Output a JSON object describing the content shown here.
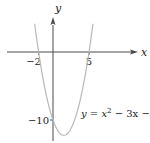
{
  "chart_data": {
    "type": "line",
    "title": "",
    "xlabel": "x",
    "ylabel": "y",
    "equation": {
      "lhs": "y = x",
      "exp": "2",
      "rhs": " − 3x − 10"
    },
    "function": {
      "a": 1,
      "b": -3,
      "c": -10
    },
    "x_ticks": [
      {
        "value": -2,
        "label": "−2"
      },
      {
        "value": 5,
        "label": "5"
      }
    ],
    "y_ticks": [
      {
        "value": -10,
        "label": "−10"
      }
    ],
    "xlim": [
      -6.4,
      11.5
    ],
    "ylim": [
      -13,
      7.6
    ],
    "curve_domain": [
      -2.55,
      5.55
    ],
    "grid": false,
    "colors": {
      "axis": "#4a4a4a",
      "curve": "#b8b8b8",
      "text": "#222222"
    }
  }
}
